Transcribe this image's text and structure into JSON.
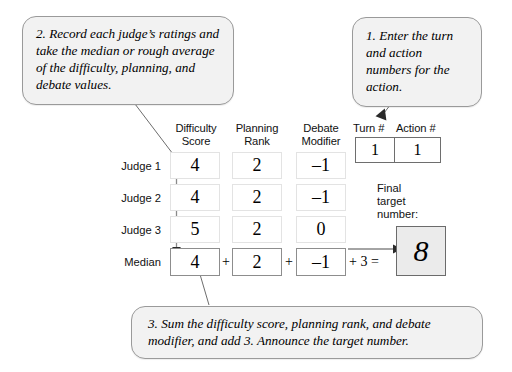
{
  "callouts": {
    "record": "2. Record each judge’s ratings and take the median or rough average of the difficulty, planning, and debate values.",
    "enter": "1. Enter the turn and action numbers for the action.",
    "sum": "3. Sum the difficulty score, planning rank, and debate modifier, and add 3. Announce the target number."
  },
  "table": {
    "column_headers": {
      "difficulty": "Difficulty\nScore",
      "planning": "Planning\nRank",
      "debate": "Debate\nModifier"
    },
    "row_labels": {
      "judge1": "Judge 1",
      "judge2": "Judge 2",
      "judge3": "Judge 3",
      "median": "Median"
    },
    "rows": [
      {
        "label": "Judge 1",
        "difficulty": "4",
        "planning": "2",
        "debate": "–1"
      },
      {
        "label": "Judge 2",
        "difficulty": "4",
        "planning": "2",
        "debate": "–1"
      },
      {
        "label": "Judge 3",
        "difficulty": "5",
        "planning": "2",
        "debate": "0"
      },
      {
        "label": "Median",
        "difficulty": "4",
        "planning": "2",
        "debate": "–1"
      }
    ],
    "operators": {
      "plus1": "+",
      "plus2": "+",
      "tail": "+ 3 ="
    }
  },
  "turn_action": {
    "turn_label": "Turn #",
    "action_label": "Action #",
    "turn_value": "1",
    "action_value": "1"
  },
  "final": {
    "label": "Final\ntarget\nnumber:",
    "value": "8"
  },
  "colors": {
    "bubble_fill": "#f2f2f2",
    "bubble_border": "#9a9a9a",
    "final_fill": "#ebebeb",
    "final_border": "#6b6b6b",
    "line": "#6d6d6d"
  }
}
